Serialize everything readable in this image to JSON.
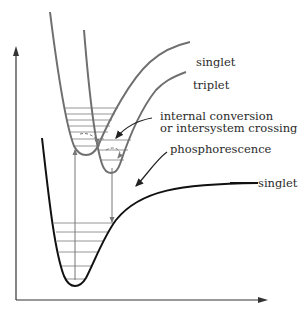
{
  "diagram": {
    "type": "potential-energy-diagram",
    "colors": {
      "ground_curve": "#111111",
      "excited_curves": "#6f6f6f",
      "levels": "#8a8a8a",
      "axes": "#333333",
      "text": "#2a2a2a"
    },
    "labels": {
      "excited_singlet": "singlet",
      "triplet": "triplet",
      "process_line1": "internal conversion",
      "process_line2": "or intersystem crossing",
      "phosphorescence": "phosphorescence",
      "ground_singlet": "singlet"
    },
    "curves": [
      {
        "name": "ground-singlet",
        "label": "singlet"
      },
      {
        "name": "excited-singlet",
        "label": "singlet"
      },
      {
        "name": "triplet",
        "label": "triplet"
      }
    ],
    "transitions": [
      {
        "name": "absorption",
        "direction": "up"
      },
      {
        "name": "phosphorescence",
        "direction": "down"
      },
      {
        "name": "internal-conversion-or-intersystem-crossing",
        "style": "dashed"
      }
    ],
    "vibrational_levels": {
      "ground_singlet": 7,
      "excited_singlet": 7,
      "triplet": 3
    }
  }
}
